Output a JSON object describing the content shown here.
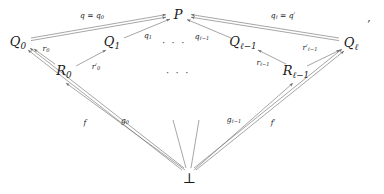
{
  "figure": {
    "type": "commutative-diagram",
    "trailing_punctuation": ",",
    "nodes": [
      {
        "id": "P",
        "label_html": "P",
        "x": 178,
        "y": 14
      },
      {
        "id": "Q0",
        "label_html": "Q<sub>0</sub>",
        "x": 18,
        "y": 43
      },
      {
        "id": "Q1",
        "label_html": "Q<sub>1</sub>",
        "x": 112,
        "y": 43
      },
      {
        "id": "Qlm1",
        "label_html": "Q<sub>ℓ−1</sub>",
        "x": 243,
        "y": 43
      },
      {
        "id": "Ql",
        "label_html": "Q<sub>ℓ</sub>",
        "x": 351,
        "y": 44
      },
      {
        "id": "R0",
        "label_html": "R<sub>0</sub>",
        "x": 64,
        "y": 72
      },
      {
        "id": "Rlm1",
        "label_html": "R<sub>ℓ−1</sub>",
        "x": 296,
        "y": 72
      },
      {
        "id": "bottom",
        "label_html": "⊥",
        "x": 189,
        "y": 178
      }
    ],
    "ellipses": [
      {
        "id": "dots-top",
        "label": "· · ·",
        "x": 174,
        "y": 43
      },
      {
        "id": "dots-middle",
        "label": "· · ·",
        "x": 178,
        "y": 73
      }
    ],
    "edge_labels": [
      {
        "id": "q-eq-q0",
        "label_html": "q = q<sub>0</sub>",
        "x": 92,
        "y": 16
      },
      {
        "id": "ql-eq-qp",
        "label_html": "q<sub>ℓ</sub> = q′",
        "x": 283,
        "y": 16
      },
      {
        "id": "q1",
        "label_html": "q<sub>1</sub>",
        "x": 148,
        "y": 36
      },
      {
        "id": "qlm1",
        "label_html": "q<sub>ℓ−1</sub>",
        "x": 202,
        "y": 37
      },
      {
        "id": "r0",
        "label_html": "r<sub>0</sub>",
        "x": 46,
        "y": 49
      },
      {
        "id": "rlm1",
        "label_html": "r<sub>ℓ−1</sub>",
        "x": 263,
        "y": 63
      },
      {
        "id": "r0p",
        "label_html": "r′<sub>0</sub>",
        "x": 96,
        "y": 67
      },
      {
        "id": "rlm1p",
        "label_html": "r′<sub>ℓ−1</sub>",
        "x": 310,
        "y": 48
      },
      {
        "id": "f",
        "label_html": "f",
        "x": 85,
        "y": 123
      },
      {
        "id": "g0",
        "label_html": "g<sub>0</sub>",
        "x": 125,
        "y": 121
      },
      {
        "id": "glm1",
        "label_html": "g<sub>ℓ−1</sub>",
        "x": 234,
        "y": 120
      },
      {
        "id": "fp",
        "label_html": "f′",
        "x": 273,
        "y": 123
      }
    ],
    "edges": [
      {
        "id": "Q0-to-P",
        "from": "Q0",
        "to": "P",
        "style": "double-arrow"
      },
      {
        "id": "Ql-to-P",
        "from": "Ql",
        "to": "P",
        "style": "double-arrow"
      },
      {
        "id": "Q1-to-P",
        "from": "Q1",
        "to": "P",
        "style": "single-arrow"
      },
      {
        "id": "Qlm1-to-P",
        "from": "Qlm1",
        "to": "P",
        "style": "single-arrow"
      },
      {
        "id": "R0-to-Q0",
        "from": "R0",
        "to": "Q0",
        "style": "single-arrow"
      },
      {
        "id": "R0-to-Q1",
        "from": "R0",
        "to": "Q1",
        "style": "single-arrow"
      },
      {
        "id": "Rlm1-to-Qlm1",
        "from": "Rlm1",
        "to": "Qlm1",
        "style": "single-arrow"
      },
      {
        "id": "Rlm1-to-Ql",
        "from": "Rlm1",
        "to": "Ql",
        "style": "single-arrow"
      },
      {
        "id": "bot-to-Q0",
        "from": "bottom",
        "to": "Q0",
        "style": "single-arrow"
      },
      {
        "id": "bot-to-R0",
        "from": "bottom",
        "to": "R0",
        "style": "single-arrow"
      },
      {
        "id": "bot-to-Rlm1",
        "from": "bottom",
        "to": "Rlm1",
        "style": "single-arrow"
      },
      {
        "id": "bot-to-Ql",
        "from": "bottom",
        "to": "Ql",
        "style": "single-arrow"
      },
      {
        "id": "bot-stub-l",
        "from": "bottom",
        "to": "dots",
        "style": "plain-line"
      },
      {
        "id": "bot-stub-r",
        "from": "bottom",
        "to": "dots",
        "style": "plain-line"
      }
    ],
    "colors": {
      "line": "#6e6e6e",
      "text": "#1a1a1a",
      "background": "#ffffff"
    }
  }
}
